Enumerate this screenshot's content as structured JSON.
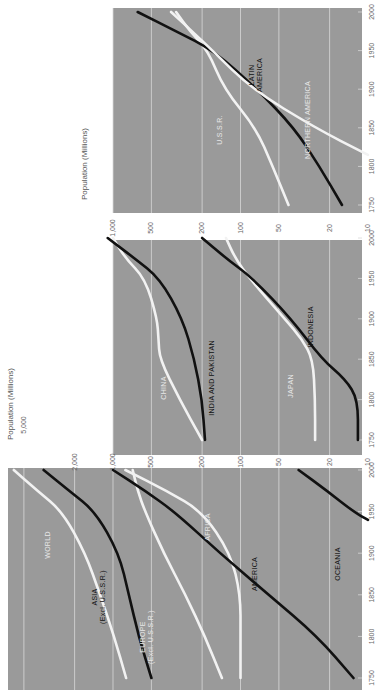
{
  "chart_data": [
    {
      "type": "line",
      "title": "",
      "xlabel": "",
      "ylabel": "Population (Millions)",
      "yscale": "log",
      "ylim": [
        10,
        5000
      ],
      "xlim": [
        1740,
        2010
      ],
      "yticks": [
        10,
        20,
        50,
        100,
        200,
        500,
        1000,
        2000,
        5000
      ],
      "ytick_labels": [
        "",
        "",
        "",
        "",
        "",
        "",
        "1,000",
        "2,000",
        "5,000"
      ],
      "xticks": [
        1750,
        1800,
        1850,
        1900,
        1950,
        2000
      ],
      "xtick_labels": [
        "1750",
        "1800",
        "1850",
        "1900",
        "1950",
        "2000"
      ],
      "grid": true,
      "series": [
        {
          "name": "WORLD",
          "color": "#f2f2f2",
          "x": [
            1750,
            1800,
            1850,
            1900,
            1950,
            1975,
            2000
          ],
          "values": [
            790,
            980,
            1260,
            1650,
            2500,
            3900,
            6000
          ]
        },
        {
          "name": "ASIA (Excl. U.S.S.R.)",
          "color": "#111111",
          "x": [
            1750,
            1800,
            1850,
            1900,
            1950,
            1975,
            2000
          ],
          "values": [
            500,
            630,
            750,
            900,
            1380,
            2200,
            3500
          ]
        },
        {
          "name": "EUROPE (Excl. U.S.S.R.)",
          "color": "#f2f2f2",
          "x": [
            1750,
            1800,
            1850,
            1900,
            1950,
            1975,
            2000
          ],
          "values": [
            140,
            190,
            270,
            400,
            560,
            640,
            700
          ]
        },
        {
          "name": "AFRICA",
          "color": "#f2f2f2",
          "x": [
            1750,
            1800,
            1850,
            1900,
            1950,
            1975,
            2000
          ],
          "values": [
            100,
            100,
            100,
            120,
            200,
            380,
            800
          ]
        },
        {
          "name": "AMERICA",
          "color": "#111111",
          "x": [
            1750,
            1800,
            1850,
            1900,
            1950,
            1975,
            2000
          ],
          "values": [
            13,
            25,
            60,
            145,
            330,
            560,
            1000
          ]
        },
        {
          "name": "OCEANIA",
          "color": "#111111",
          "x": [
            1940,
            1950,
            1975,
            2000
          ],
          "values": [
            10,
            13,
            21,
            35
          ]
        }
      ],
      "annotations": [
        "WORLD",
        "ASIA (Excl. U.S.S.R.)",
        "EUROPE (Excl. U.S.S.R.)",
        "AFRICA",
        "AMERICA",
        "OCEANIA"
      ]
    },
    {
      "type": "line",
      "title": "",
      "xlabel": "",
      "ylabel": "Population (Millions)",
      "yscale": "log",
      "ylim": [
        10,
        1000
      ],
      "xlim": [
        1740,
        2010
      ],
      "yticks": [
        10,
        20,
        50,
        100,
        200,
        500,
        1000
      ],
      "ytick_labels": [
        "10",
        "20",
        "50",
        "100",
        "200",
        "500",
        "1,000"
      ],
      "xticks": [
        1750,
        1800,
        1850,
        1900,
        1950,
        2000
      ],
      "xtick_labels": [
        "1750",
        "1800",
        "1850",
        "1900",
        "1950",
        "2000"
      ],
      "grid": true,
      "series": [
        {
          "name": "CHINA",
          "color": "#f2f2f2",
          "x": [
            1750,
            1800,
            1850,
            1875,
            1900,
            1950,
            1975,
            2000
          ],
          "values": [
            200,
            300,
            430,
            440,
            450,
            560,
            800,
            1000
          ]
        },
        {
          "name": "INDIA AND PAKISTAN",
          "color": "#111111",
          "x": [
            1750,
            1800,
            1850,
            1900,
            1950,
            1975,
            2000
          ],
          "values": [
            190,
            200,
            230,
            285,
            430,
            680,
            1100
          ]
        },
        {
          "name": "JAPAN",
          "color": "#f2f2f2",
          "x": [
            1750,
            1800,
            1850,
            1875,
            1900,
            1950,
            1975,
            2000
          ],
          "values": [
            26,
            26,
            27,
            33,
            45,
            85,
            110,
            130
          ]
        },
        {
          "name": "INDONESIA",
          "color": "#111111",
          "x": [
            1750,
            1800,
            1825,
            1850,
            1900,
            1950,
            1975,
            2000
          ],
          "values": [
            12,
            12,
            15,
            23,
            40,
            80,
            130,
            200
          ]
        }
      ],
      "annotations": [
        "CHINA",
        "INDIA AND PAKISTAN",
        "JAPAN",
        "INDONESIA"
      ]
    },
    {
      "type": "line",
      "title": "",
      "xlabel": "",
      "ylabel": "",
      "yscale": "log",
      "ylim": [
        10,
        1000
      ],
      "xlim": [
        1740,
        2010
      ],
      "yticks": [
        10,
        20,
        50,
        100,
        200,
        500,
        1000
      ],
      "ytick_labels": [
        "10",
        "20",
        "50",
        "100",
        "200",
        "500",
        "1,000"
      ],
      "xticks": [
        1750,
        1800,
        1850,
        1900,
        1950,
        2000
      ],
      "xtick_labels": [
        "1750",
        "1800",
        "1850",
        "1900",
        "1950",
        "2000"
      ],
      "grid": true,
      "series": [
        {
          "name": "U.S.S.R.",
          "color": "#f2f2f2",
          "x": [
            1750,
            1800,
            1850,
            1900,
            1950,
            1975,
            2000
          ],
          "values": [
            42,
            56,
            76,
            134,
            180,
            250,
            320
          ]
        },
        {
          "name": "LATIN AMERICA",
          "color": "#111111",
          "x": [
            1750,
            1800,
            1850,
            1900,
            1950,
            1975,
            2000
          ],
          "values": [
            16,
            24,
            38,
            74,
            162,
            320,
            640
          ]
        },
        {
          "name": "NORTHERN AMERICA",
          "color": "#f2f2f2",
          "x": [
            1815,
            1850,
            1900,
            1950,
            1975,
            2000
          ],
          "values": [
            10,
            26,
            81,
            166,
            240,
            350
          ]
        }
      ],
      "annotations": [
        "U.S.S.R.",
        "LATIN AMERICA",
        "NORTHERN AMERICA"
      ]
    }
  ]
}
